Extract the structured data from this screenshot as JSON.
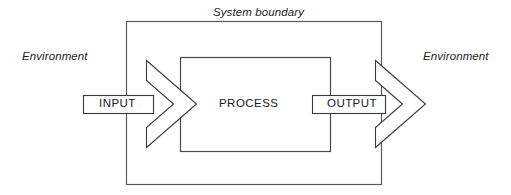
{
  "diagram": {
    "type": "system-model-block-diagram",
    "title_label": "System boundary",
    "environment_left": "Environment",
    "environment_right": "Environment",
    "blocks": {
      "input": "INPUT",
      "process": "PROCESS",
      "output": "OUTPUT"
    },
    "colors": {
      "background": "#ffffff",
      "boundary_stroke": "#5a5a5a",
      "inner_stroke": "#4a4a4a",
      "arrow_stroke": "#3a3a3a",
      "arrow_fill": "#ffffff",
      "text": "#1a1a1a"
    },
    "geometry": {
      "system_boundary": {
        "x": 126,
        "y": 21,
        "width": 256,
        "height": 164
      },
      "process_box": {
        "x": 180,
        "y": 57,
        "width": 151,
        "height": 95
      },
      "input_bar": {
        "x": 83,
        "y": 95,
        "width": 70,
        "height": 19
      },
      "output_bar": {
        "x": 312,
        "y": 95,
        "width": 73,
        "height": 19
      },
      "input_chevron": {
        "tip_x": 196,
        "tip_y": 104,
        "top_y": 60,
        "bottom_y": 148
      },
      "output_chevron": {
        "tip_x": 425,
        "tip_y": 104,
        "top_y": 60,
        "bottom_y": 148
      }
    }
  }
}
